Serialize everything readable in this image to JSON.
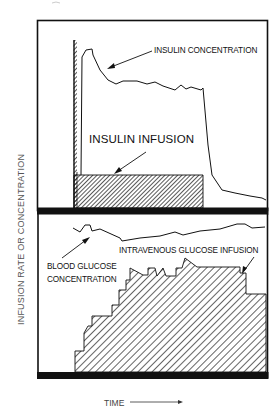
{
  "figure": {
    "y_axis_label": "INFUSION RATE OR CONCENTRATION",
    "x_axis_label": "TIME",
    "x_axis_arrow": "right-arrow",
    "top_panel": {
      "labels": {
        "insulin_concentration": "INSULIN CONCENTRATION",
        "insulin_infusion": "INSULIN INFUSION"
      },
      "series": [
        {
          "name": "Insulin concentration",
          "style": "line"
        },
        {
          "name": "Insulin infusion",
          "style": "hatched-area"
        }
      ]
    },
    "bottom_panel": {
      "labels": {
        "intravenous_glucose_infusion": "INTRAVENOUS GLUCOSE INFUSION",
        "blood_glucose_line1": "BLOOD GLUCOSE",
        "blood_glucose_line2": "CONCENTRATION"
      },
      "series": [
        {
          "name": "Blood glucose concentration",
          "style": "line"
        },
        {
          "name": "Intravenous glucose infusion",
          "style": "hatched-stepped-area"
        }
      ]
    },
    "colors": {
      "ink": "#111111",
      "axis_label": "#555555",
      "background": "#ffffff"
    }
  }
}
